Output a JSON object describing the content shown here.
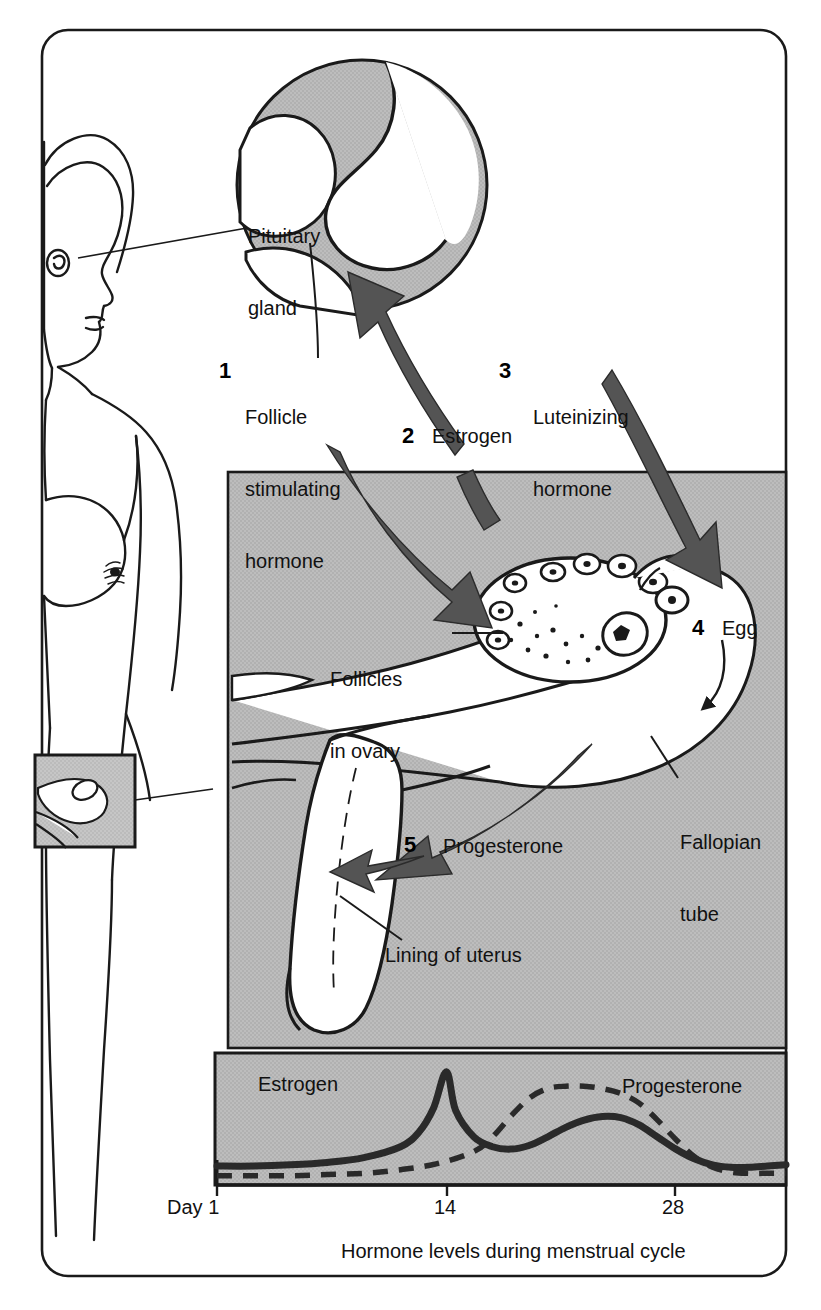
{
  "figure": {
    "title_caption": "Hormone levels during menstrual cycle",
    "frame_color": "#1a1a1a",
    "panel_gray": "#b9b9b9",
    "arrow_gray": "#545454",
    "ink": "#111111"
  },
  "anatomy": {
    "pituitary_label": "Pituitary\ngland",
    "pituitary_line1": "Pituitary",
    "pituitary_line2": "gland",
    "follicles_line1": "Follicles",
    "follicles_line2": "in ovary",
    "egg_label": "Egg",
    "fallopian_line1": "Fallopian",
    "fallopian_line2": "tube",
    "lining_label": "Lining of uterus"
  },
  "steps": [
    {
      "number": "1",
      "label_line1": "Follicle",
      "label_line2": "stimulating",
      "label_line3": "hormone",
      "name": "follicle-stimulating-hormone"
    },
    {
      "number": "2",
      "label_line1": "Estrogen",
      "label_line2": "",
      "label_line3": "",
      "name": "estrogen"
    },
    {
      "number": "3",
      "label_line1": "Luteinizing",
      "label_line2": "hormone",
      "label_line3": "",
      "name": "luteinizing-hormone"
    },
    {
      "number": "4",
      "label_line1": "Egg",
      "label_line2": "",
      "label_line3": "",
      "name": "egg"
    },
    {
      "number": "5",
      "label_line1": "Progesterone",
      "label_line2": "",
      "label_line3": "",
      "name": "progesterone"
    }
  ],
  "chart_data": {
    "type": "line",
    "title": "Hormone levels during menstrual cycle",
    "xlabel": "Day",
    "ylabel": "",
    "xlim": [
      1,
      32
    ],
    "ylim": [
      0,
      100
    ],
    "grid": false,
    "legend_position": "inline",
    "x_axis_prefix": "Day",
    "tick_labels": [
      "1",
      "14",
      "28"
    ],
    "tick_values": [
      1,
      14,
      28
    ],
    "series": [
      {
        "name": "Estrogen",
        "style": "solid",
        "color": "#2a2a2a",
        "label_x": 8,
        "x": [
          1,
          3,
          5,
          7,
          9,
          11,
          12,
          12.8,
          13.5,
          14,
          15,
          16,
          17,
          18,
          19,
          20,
          21,
          22,
          23,
          24,
          25,
          26,
          27,
          28,
          29,
          30,
          31,
          32
        ],
        "y": [
          14,
          14,
          15,
          17,
          21,
          30,
          42,
          62,
          92,
          60,
          38,
          30,
          28,
          31,
          38,
          46,
          52,
          55,
          54,
          48,
          38,
          28,
          20,
          15,
          13,
          13,
          14,
          15
        ]
      },
      {
        "name": "Progesterone",
        "style": "dashed",
        "color": "#2a2a2a",
        "label_x": 26,
        "x": [
          1,
          3,
          5,
          7,
          9,
          11,
          13,
          15,
          16,
          17,
          18,
          19,
          20,
          21,
          22,
          23,
          24,
          25,
          26,
          27,
          28,
          29,
          30,
          31,
          32
        ],
        "y": [
          6,
          6,
          6,
          7,
          8,
          11,
          16,
          26,
          38,
          55,
          70,
          78,
          80,
          80,
          78,
          74,
          66,
          52,
          36,
          22,
          13,
          9,
          8,
          8,
          8
        ]
      }
    ]
  }
}
